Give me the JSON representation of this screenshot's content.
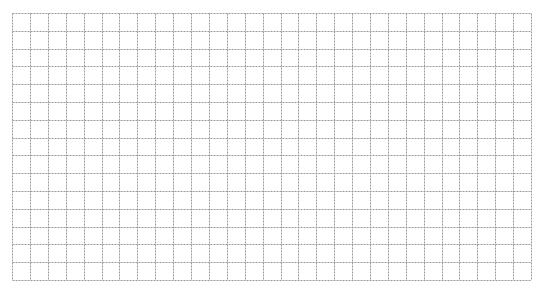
{
  "grid": {
    "left": 12,
    "top": 13,
    "columns": 29,
    "rows": 15,
    "cell_width": 17.9,
    "cell_height": 17.8,
    "line_color": "#9a9a9a",
    "line_style": "dashed",
    "background": "#ffffff"
  }
}
